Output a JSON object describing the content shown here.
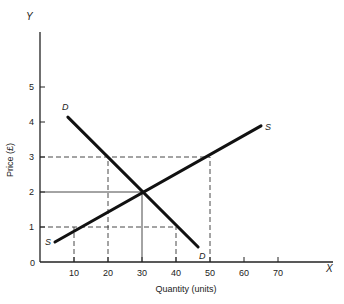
{
  "chart_data": {
    "type": "line",
    "title": "",
    "xlabel": "Quantity (units)",
    "ylabel": "Price (£)",
    "x_axis_letter": "X",
    "y_axis_letter": "Y",
    "xlim": [
      0,
      85
    ],
    "ylim": [
      0,
      6.3
    ],
    "x_ticks": [
      10,
      20,
      30,
      40,
      50,
      60,
      70
    ],
    "y_ticks": [
      1,
      2,
      3,
      4,
      5
    ],
    "origin_label": "0",
    "grid": false,
    "series": [
      {
        "name": "D",
        "kind": "demand",
        "points": [
          [
            8.2,
            4.14
          ],
          [
            46.5,
            0.43
          ]
        ],
        "start_label": "D",
        "end_label": "D"
      },
      {
        "name": "S",
        "kind": "supply",
        "points": [
          [
            4.4,
            0.57
          ],
          [
            65.0,
            3.89
          ]
        ],
        "start_label": "S",
        "end_label": "S"
      }
    ],
    "equilibrium": {
      "x": 30,
      "y": 2
    },
    "guide_lines": [
      {
        "style": "solid",
        "from": [
          0,
          2
        ],
        "to": [
          30,
          2
        ]
      },
      {
        "style": "solid",
        "from": [
          30,
          0
        ],
        "to": [
          30,
          2
        ]
      },
      {
        "style": "dashed",
        "from": [
          0,
          3
        ],
        "to": [
          50,
          3
        ]
      },
      {
        "style": "dashed",
        "from": [
          20,
          0
        ],
        "to": [
          20,
          3
        ]
      },
      {
        "style": "dashed",
        "from": [
          50,
          0
        ],
        "to": [
          50,
          3
        ]
      },
      {
        "style": "dashed",
        "from": [
          0,
          1
        ],
        "to": [
          40,
          1
        ]
      },
      {
        "style": "dashed",
        "from": [
          10,
          0
        ],
        "to": [
          10,
          1
        ]
      },
      {
        "style": "dashed",
        "from": [
          40,
          0
        ],
        "to": [
          40,
          1
        ]
      }
    ],
    "legend": null
  },
  "labels": {
    "xlabel": "Quantity (units)",
    "ylabel": "Price (£)",
    "x_letter": "X",
    "y_letter": "Y",
    "origin": "0",
    "x_ticks": [
      "10",
      "20",
      "30",
      "40",
      "50",
      "60",
      "70"
    ],
    "y_ticks": [
      "1",
      "2",
      "3",
      "4",
      "5"
    ],
    "demand_start": "D",
    "demand_end": "D",
    "supply_start": "S",
    "supply_end": "S"
  }
}
